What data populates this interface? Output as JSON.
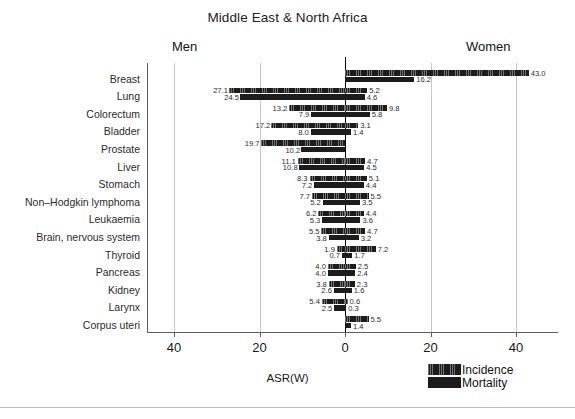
{
  "chart_data": {
    "type": "bar",
    "title": "Middle East & North Africa",
    "xlabel": "ASR(W)",
    "ylabel": "",
    "orientation": "horizontal-diverging",
    "left_panel_label": "Men",
    "right_panel_label": "Women",
    "xlim": [
      -47,
      47
    ],
    "xticks": [
      -40,
      -20,
      0,
      20,
      40
    ],
    "xticklabels": [
      "40",
      "20",
      "0",
      "20",
      "40"
    ],
    "grid": true,
    "legend_position": "bottom-right",
    "legend": [
      "Incidence",
      "Mortality"
    ],
    "bar_color": "#1c1c1c",
    "categories": [
      "Breast",
      "Lung",
      "Colorectum",
      "Bladder",
      "Prostate",
      "Liver",
      "Stomach",
      "Non–Hodgkin lymphoma",
      "Leukaemia",
      "Brain, nervous system",
      "Thyroid",
      "Pancreas",
      "Kidney",
      "Larynx",
      "Corpus uteri"
    ],
    "series": [
      {
        "name": "Men Incidence",
        "side": "left",
        "measure": "incidence",
        "values": [
          null,
          27.1,
          13.2,
          17.2,
          19.7,
          11.1,
          8.3,
          7.7,
          6.2,
          5.5,
          1.9,
          4.0,
          3.8,
          5.4,
          null
        ]
      },
      {
        "name": "Men Mortality",
        "side": "left",
        "measure": "mortality",
        "values": [
          null,
          24.5,
          7.9,
          8.0,
          10.2,
          10.8,
          7.2,
          5.2,
          5.3,
          3.8,
          0.7,
          4.0,
          2.6,
          2.5,
          null
        ]
      },
      {
        "name": "Women Incidence",
        "side": "right",
        "measure": "incidence",
        "values": [
          43.0,
          5.2,
          9.8,
          3.1,
          null,
          4.7,
          5.1,
          5.5,
          4.4,
          4.7,
          7.2,
          2.5,
          2.3,
          0.6,
          5.5
        ]
      },
      {
        "name": "Women Mortality",
        "side": "right",
        "measure": "mortality",
        "values": [
          16.2,
          4.6,
          5.8,
          1.4,
          null,
          4.5,
          4.4,
          3.5,
          3.6,
          3.2,
          1.7,
          2.4,
          1.6,
          0.3,
          1.4
        ]
      }
    ]
  }
}
